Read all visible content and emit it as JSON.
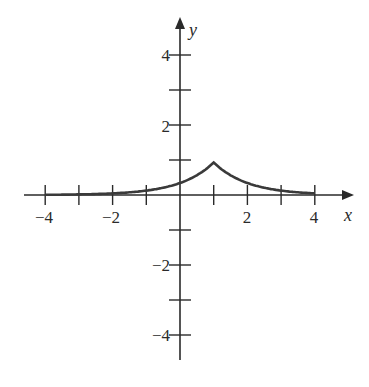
{
  "chart_data": {
    "type": "line",
    "title": "",
    "xlabel": "x",
    "ylabel": "y",
    "xlim": [
      -4.7,
      5.1
    ],
    "ylim": [
      -4.9,
      5.3
    ],
    "grid": false,
    "x_ticks": [
      -4,
      -3,
      -2,
      -1,
      1,
      2,
      3,
      4
    ],
    "x_tick_labels": [
      "-4",
      "-2",
      "2",
      "4"
    ],
    "y_ticks": [
      -4,
      -3,
      -2,
      -1,
      1,
      2,
      3,
      4
    ],
    "y_tick_labels": [
      "-4",
      "-2",
      "2",
      "4"
    ],
    "series": [
      {
        "name": "f(x) = e^{-|x-1|}",
        "x": [
          -4,
          -3,
          -2,
          -1,
          0,
          0.5,
          1,
          1.5,
          2,
          3,
          4
        ],
        "y": [
          0.007,
          0.018,
          0.05,
          0.135,
          0.368,
          0.607,
          1.0,
          0.607,
          0.368,
          0.135,
          0.05
        ]
      }
    ],
    "annotations": [
      "cusp at (1, 1)"
    ]
  },
  "labels": {
    "x_axis": "x",
    "y_axis": "y",
    "x_neg4": "−4",
    "x_neg2": "−2",
    "x_2": "2",
    "x_4": "4",
    "y_4": "4",
    "y_2": "2",
    "y_neg2": "−2",
    "y_neg4": "−4"
  },
  "colors": {
    "axis": "#2a2a2a",
    "curve": "#3a3a3a"
  }
}
